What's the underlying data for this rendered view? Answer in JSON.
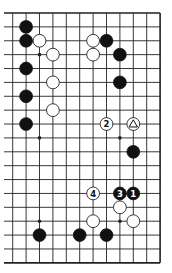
{
  "diagram": {
    "type": "go-board-fragment",
    "grid": {
      "columns": 12,
      "rows": 19,
      "origin_x": 12.7,
      "origin_y": 13,
      "spacing_x": 13.4,
      "spacing_y": 13.88,
      "left_edge_open": true,
      "line_start_x": 4,
      "top_border": true,
      "right_border": true,
      "bottom_border": true
    },
    "colors": {
      "line": "#222222",
      "black_stone": "#111111",
      "white_stone": "#ffffff",
      "background": "#ffffff"
    },
    "star_points": [
      {
        "col": 2,
        "row": 3
      },
      {
        "col": 2,
        "row": 9
      },
      {
        "col": 8,
        "row": 9
      },
      {
        "col": 2,
        "row": 15
      },
      {
        "col": 8,
        "row": 15
      }
    ],
    "stones": [
      {
        "color": "black",
        "col": 1,
        "row": 1,
        "label": ""
      },
      {
        "color": "black",
        "col": 1,
        "row": 2,
        "label": ""
      },
      {
        "color": "white",
        "col": 2,
        "row": 2,
        "label": ""
      },
      {
        "color": "white",
        "col": 3,
        "row": 3,
        "label": ""
      },
      {
        "color": "black",
        "col": 1,
        "row": 4,
        "label": ""
      },
      {
        "color": "white",
        "col": 3,
        "row": 5,
        "label": ""
      },
      {
        "color": "black",
        "col": 1,
        "row": 6,
        "label": ""
      },
      {
        "color": "white",
        "col": 3,
        "row": 7,
        "label": ""
      },
      {
        "color": "black",
        "col": 1,
        "row": 8,
        "label": ""
      },
      {
        "color": "white",
        "col": 6,
        "row": 2,
        "label": ""
      },
      {
        "color": "black",
        "col": 7,
        "row": 2,
        "label": ""
      },
      {
        "color": "white",
        "col": 6,
        "row": 3,
        "label": ""
      },
      {
        "color": "black",
        "col": 8,
        "row": 3,
        "label": ""
      },
      {
        "color": "black",
        "col": 8,
        "row": 5,
        "label": ""
      },
      {
        "color": "white",
        "col": 7,
        "row": 8,
        "label": "2"
      },
      {
        "color": "white",
        "col": 9,
        "row": 8,
        "label": "",
        "marker": "triangle"
      },
      {
        "color": "black",
        "col": 9,
        "row": 10,
        "label": ""
      },
      {
        "color": "white",
        "col": 6,
        "row": 13,
        "label": "4"
      },
      {
        "color": "black",
        "col": 8,
        "row": 13,
        "label": "3"
      },
      {
        "color": "black",
        "col": 9,
        "row": 13,
        "label": "1"
      },
      {
        "color": "white",
        "col": 8,
        "row": 14,
        "label": ""
      },
      {
        "color": "white",
        "col": 6,
        "row": 15,
        "label": ""
      },
      {
        "color": "white",
        "col": 9,
        "row": 15,
        "label": ""
      },
      {
        "color": "black",
        "col": 2,
        "row": 16,
        "label": ""
      },
      {
        "color": "black",
        "col": 5,
        "row": 16,
        "label": ""
      },
      {
        "color": "black",
        "col": 7,
        "row": 16,
        "label": ""
      }
    ]
  }
}
